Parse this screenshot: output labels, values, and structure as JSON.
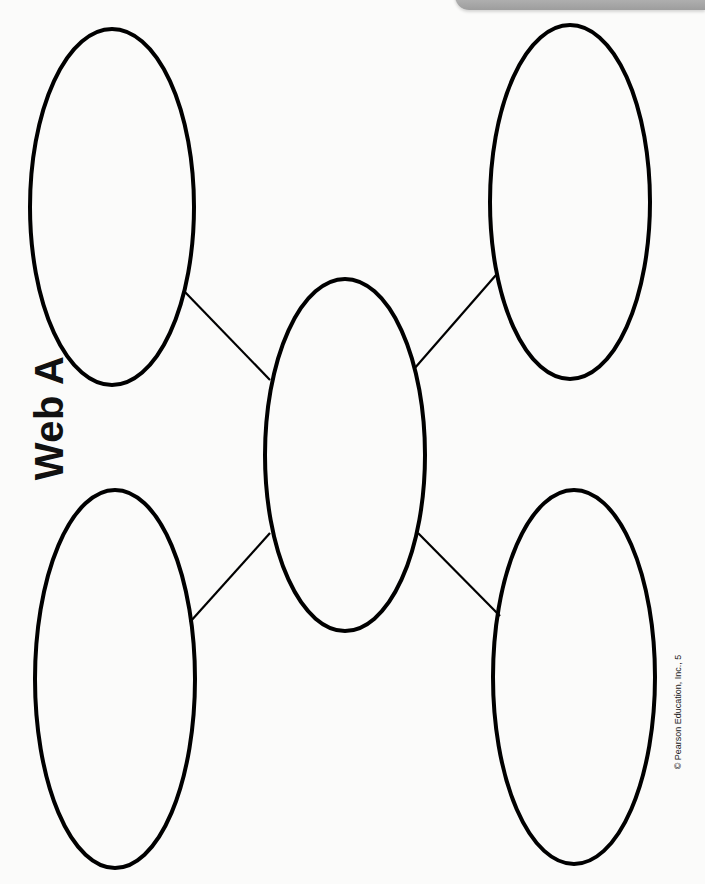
{
  "worksheet": {
    "title": "Web A",
    "copyright": "© Pearson Education, Inc., 5"
  },
  "diagram": {
    "type": "web",
    "stroke_color": "#000000",
    "background_color": "#fbfbfa",
    "nodes": [
      {
        "id": "center",
        "label": "",
        "cx": 345,
        "cy": 455,
        "rx": 80,
        "ry": 176
      },
      {
        "id": "top-left",
        "label": "",
        "cx": 112,
        "cy": 207,
        "rx": 82,
        "ry": 178
      },
      {
        "id": "top-right",
        "label": "",
        "cx": 570,
        "cy": 202,
        "rx": 80,
        "ry": 177
      },
      {
        "id": "bottom-left",
        "label": "",
        "cx": 115,
        "cy": 679,
        "rx": 80,
        "ry": 189
      },
      {
        "id": "bottom-right",
        "label": "",
        "cx": 574,
        "cy": 677,
        "rx": 81,
        "ry": 187
      }
    ],
    "connectors": [
      {
        "from": "center",
        "to": "top-left",
        "x1": 270,
        "y1": 380,
        "x2": 184,
        "y2": 291
      },
      {
        "from": "center",
        "to": "top-right",
        "x1": 414,
        "y1": 369,
        "x2": 496,
        "y2": 275
      },
      {
        "from": "center",
        "to": "bottom-left",
        "x1": 270,
        "y1": 533,
        "x2": 190,
        "y2": 622
      },
      {
        "from": "center",
        "to": "bottom-right",
        "x1": 418,
        "y1": 533,
        "x2": 500,
        "y2": 616
      }
    ]
  }
}
